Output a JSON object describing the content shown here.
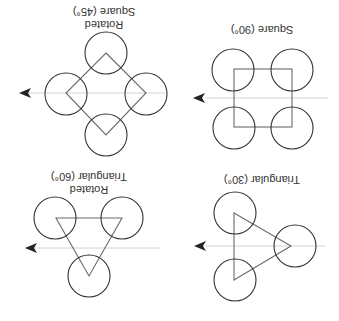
{
  "figure": {
    "orientation": "rotated 180 degrees",
    "panels": [
      {
        "id": "rotated-square",
        "label_line1": "Rotated",
        "label_line2": "Square (45°)",
        "pattern": "rotated square",
        "angle": "45°",
        "circle_count": 4
      },
      {
        "id": "square",
        "label_line1": "Square (90°)",
        "label_line2": "",
        "pattern": "square",
        "angle": "90°",
        "circle_count": 4
      },
      {
        "id": "rotated-triangular",
        "label_line1": "Rotated",
        "label_line2": "Triangular (60°)",
        "pattern": "rotated triangular",
        "angle": "60°",
        "circle_count": 3
      },
      {
        "id": "triangular",
        "label_line1": "Triangular (30°)",
        "label_line2": "",
        "pattern": "triangular",
        "angle": "30°",
        "circle_count": 3
      }
    ],
    "colors": {
      "circle_stroke": "#333333",
      "shape_stroke": "#6a6a6a",
      "flow_line": "#d4d4d4",
      "arrowhead": "#222222",
      "background": "#ffffff"
    }
  }
}
